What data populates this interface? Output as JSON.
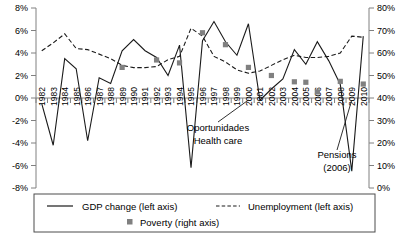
{
  "chart_data": {
    "type": "line",
    "title": "",
    "subtitle": "",
    "xlabel": "",
    "ylabel": "",
    "grid": false,
    "legend_position": "bottom",
    "x": [
      1982,
      1983,
      1984,
      1985,
      1986,
      1987,
      1988,
      1989,
      1990,
      1991,
      1992,
      1993,
      1994,
      1995,
      1996,
      1997,
      1998,
      1999,
      2000,
      2001,
      2002,
      2003,
      2004,
      2005,
      2006,
      2007,
      2008,
      2009,
      2010
    ],
    "xtick_labels": [
      "1982",
      "1983",
      "1984",
      "1985",
      "1986",
      "1987",
      "1988",
      "1989",
      "1990",
      "1991",
      "1992",
      "1993",
      "1994",
      "1995",
      "1996",
      "1997",
      "1998",
      "1999",
      "2000",
      "2001",
      "2002",
      "2003",
      "2004",
      "2005",
      "2006",
      "2007",
      "2008",
      "2009",
      "2010"
    ],
    "left_axis": {
      "label": "",
      "ylim": [
        -8,
        8
      ],
      "tick_values": [
        -8,
        -6,
        -4,
        -2,
        0,
        2,
        4,
        6,
        8
      ],
      "tick_labels": [
        "-8%",
        "-6%",
        "-4%",
        "-2%",
        "0%",
        "2%",
        "4%",
        "6%",
        "8%"
      ]
    },
    "right_axis": {
      "label": "",
      "ylim": [
        0,
        80
      ],
      "tick_values": [
        0,
        10,
        20,
        30,
        40,
        50,
        60,
        70,
        80
      ],
      "tick_labels": [
        "0%",
        "10%",
        "20%",
        "30%",
        "40%",
        "50%",
        "60%",
        "70%",
        "80%"
      ]
    },
    "series": [
      {
        "name": "GDP change (left axis)",
        "axis": "left",
        "style": "solid-line",
        "color": "#1a1a1a",
        "values": [
          -0.5,
          -4.2,
          3.5,
          2.6,
          -3.8,
          1.8,
          1.3,
          4.2,
          5.2,
          4.2,
          3.6,
          2.0,
          4.7,
          -6.2,
          5.1,
          6.8,
          5.0,
          3.8,
          6.6,
          -0.2,
          0.8,
          1.7,
          4.3,
          3.0,
          5.0,
          3.3,
          1.2,
          -6.5,
          5.5
        ]
      },
      {
        "name": "Unemployment (left axis)",
        "axis": "left",
        "style": "dashed-line",
        "color": "#1a1a1a",
        "values": [
          4.2,
          4.9,
          5.7,
          4.4,
          4.3,
          3.9,
          3.5,
          2.9,
          2.7,
          2.7,
          2.8,
          3.4,
          3.7,
          6.2,
          5.5,
          3.7,
          3.2,
          2.5,
          2.2,
          2.4,
          2.9,
          3.4,
          3.8,
          3.6,
          3.6,
          3.7,
          4.0,
          5.5,
          5.4
        ]
      },
      {
        "name": "Poverty (right axis)",
        "axis": "right",
        "style": "square-markers",
        "color": "#808080",
        "points": [
          {
            "x": 1989,
            "y": 53.6
          },
          {
            "x": 1992,
            "y": 56.9
          },
          {
            "x": 1994,
            "y": 55.6
          },
          {
            "x": 1996,
            "y": 69.0
          },
          {
            "x": 1998,
            "y": 63.7
          },
          {
            "x": 2000,
            "y": 53.6
          },
          {
            "x": 2002,
            "y": 50.0
          },
          {
            "x": 2004,
            "y": 47.2
          },
          {
            "x": 2005,
            "y": 47.0
          },
          {
            "x": 2006,
            "y": 42.7
          },
          {
            "x": 2008,
            "y": 47.4
          },
          {
            "x": 2010,
            "y": 46.2
          }
        ]
      }
    ],
    "annotations": [
      {
        "name": "oportunidades",
        "line1": "Oportunidades",
        "line2": "Health care",
        "x_year": 2000
      },
      {
        "name": "pensions",
        "line1": "Pensions",
        "line2": "(2006)",
        "x_year": 2009
      }
    ]
  },
  "legend": {
    "entries": [
      {
        "label": "GDP change (left axis)",
        "marker": "solid-line"
      },
      {
        "label": "Unemployment (left axis)",
        "marker": "dashed-line"
      },
      {
        "label": "Poverty (right axis)",
        "marker": "square"
      }
    ]
  }
}
